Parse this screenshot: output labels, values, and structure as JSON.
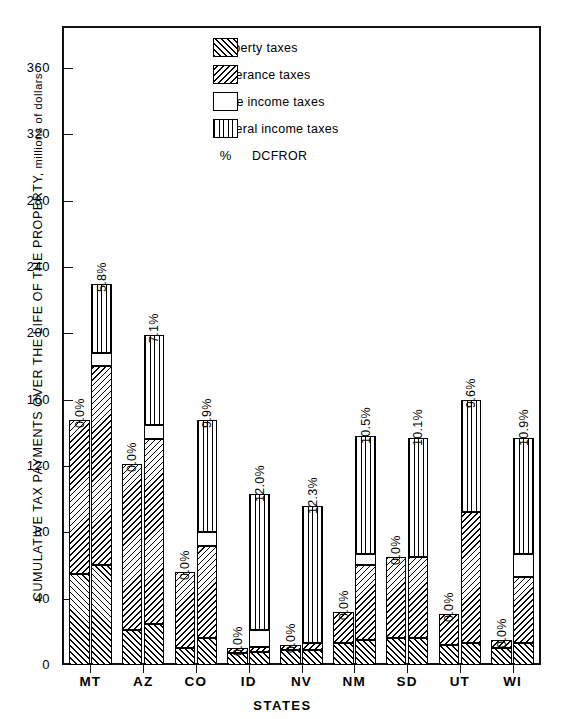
{
  "chart_data": {
    "type": "bar",
    "title": "",
    "xlabel": "STATES",
    "ylabel": "CUMULATIVE TAX PAYMENTS OVER THE LIFE OF THE PROPERTY, millions of dollars",
    "ylim": [
      0,
      360
    ],
    "yticks": [
      0,
      40,
      80,
      120,
      160,
      200,
      240,
      280,
      320,
      360
    ],
    "grid": false,
    "legend_position": "upper-center",
    "stacked": true,
    "categories": [
      "MT",
      "AZ",
      "CO",
      "ID",
      "NV",
      "NM",
      "SD",
      "UT",
      "WI"
    ],
    "segment_names": [
      "Property taxes",
      "Severance taxes",
      "State income taxes",
      "Federal income taxes"
    ],
    "groups": [
      {
        "category": "MT",
        "bars": [
          {
            "dcfror": "0.0%",
            "total": 148,
            "property": 55,
            "severance": 93,
            "state_income": 0,
            "federal_income": 0
          },
          {
            "dcfror": "5.8%",
            "total": 230,
            "property": 60,
            "severance": 120,
            "state_income": 8,
            "federal_income": 42
          }
        ]
      },
      {
        "category": "AZ",
        "bars": [
          {
            "dcfror": "0.0%",
            "total": 121,
            "property": 21,
            "severance": 100,
            "state_income": 0,
            "federal_income": 0
          },
          {
            "dcfror": "7.1%",
            "total": 199,
            "property": 25,
            "severance": 111,
            "state_income": 9,
            "federal_income": 54
          }
        ]
      },
      {
        "category": "CO",
        "bars": [
          {
            "dcfror": "0.0%",
            "total": 56,
            "property": 10,
            "severance": 46,
            "state_income": 0,
            "federal_income": 0
          },
          {
            "dcfror": "9.9%",
            "total": 148,
            "property": 16,
            "severance": 56,
            "state_income": 8,
            "federal_income": 68
          }
        ]
      },
      {
        "category": "ID",
        "bars": [
          {
            "dcfror": "0.0%",
            "total": 10,
            "property": 7,
            "severance": 3,
            "state_income": 0,
            "federal_income": 0
          },
          {
            "dcfror": "12.0%",
            "total": 103,
            "property": 8,
            "severance": 3,
            "state_income": 10,
            "federal_income": 82
          }
        ]
      },
      {
        "category": "NV",
        "bars": [
          {
            "dcfror": "0.0%",
            "total": 12,
            "property": 9,
            "severance": 3,
            "state_income": 0,
            "federal_income": 0
          },
          {
            "dcfror": "12.3%",
            "total": 96,
            "property": 9,
            "severance": 4,
            "state_income": 0,
            "federal_income": 83
          }
        ]
      },
      {
        "category": "NM",
        "bars": [
          {
            "dcfror": "0.0%",
            "total": 32,
            "property": 13,
            "severance": 19,
            "state_income": 0,
            "federal_income": 0
          },
          {
            "dcfror": "10.5%",
            "total": 138,
            "property": 15,
            "severance": 45,
            "state_income": 7,
            "federal_income": 71
          }
        ]
      },
      {
        "category": "SD",
        "bars": [
          {
            "dcfror": "0.0%",
            "total": 65,
            "property": 16,
            "severance": 49,
            "state_income": 0,
            "federal_income": 0
          },
          {
            "dcfror": "10.1%",
            "total": 137,
            "property": 16,
            "severance": 49,
            "state_income": 0,
            "federal_income": 72
          }
        ]
      },
      {
        "category": "UT",
        "bars": [
          {
            "dcfror": "0.0%",
            "total": 31,
            "property": 12,
            "severance": 19,
            "state_income": 0,
            "federal_income": 0
          },
          {
            "dcfror": "9.6%",
            "total": 160,
            "property": 13,
            "severance": 79,
            "state_income": 0,
            "federal_income": 68
          }
        ]
      },
      {
        "category": "WI",
        "bars": [
          {
            "dcfror": "0.0%",
            "total": 15,
            "property": 10,
            "severance": 5,
            "state_income": 0,
            "federal_income": 0
          },
          {
            "dcfror": "10.9%",
            "total": 137,
            "property": 13,
            "severance": 40,
            "state_income": 14,
            "federal_income": 70
          }
        ]
      }
    ],
    "legend": [
      {
        "symbol": "hatch-up",
        "label": "Property taxes"
      },
      {
        "symbol": "hatch-down",
        "label": "Severance taxes"
      },
      {
        "symbol": "white",
        "label": "State income taxes"
      },
      {
        "symbol": "vertical-lines",
        "label": "Federal income taxes"
      },
      {
        "symbol": "%",
        "label": "DCFROR"
      }
    ]
  },
  "axis": {
    "y_title_main": "CUMULATIVE TAX PAYMENTS OVER THE LIFE OF THE PROPERTY,",
    "y_title_sub": " millions of dollars",
    "x_title": "STATES"
  },
  "colors": {
    "ink": "#111111",
    "paper": "#ffffff"
  }
}
